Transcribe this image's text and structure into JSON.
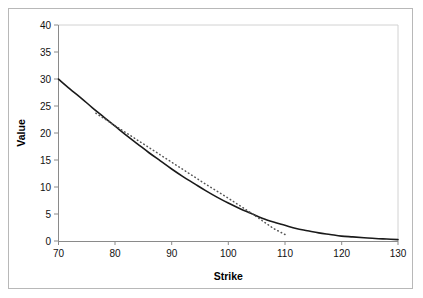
{
  "chart_data": {
    "type": "line",
    "title": "",
    "xlabel": "Strike",
    "ylabel": "Value",
    "xlim": [
      70,
      130
    ],
    "ylim": [
      0,
      40
    ],
    "xticks": [
      70,
      80,
      90,
      100,
      110,
      120,
      130
    ],
    "yticks": [
      0,
      5,
      10,
      15,
      20,
      25,
      30,
      35,
      40
    ],
    "grid": false,
    "legend": "none",
    "series": [
      {
        "name": "solid-curve",
        "style": "solid",
        "color": "#1a1a1a",
        "x": [
          70,
          72,
          74,
          76,
          78,
          80,
          82,
          84,
          86,
          88,
          90,
          92,
          94,
          96,
          98,
          100,
          102,
          104,
          106,
          108,
          110,
          112,
          114,
          116,
          118,
          120,
          122,
          124,
          126,
          128,
          130
        ],
        "y": [
          30.0,
          28.2,
          26.5,
          24.7,
          23.0,
          21.3,
          19.6,
          18.0,
          16.4,
          14.9,
          13.4,
          12.0,
          10.7,
          9.4,
          8.2,
          7.1,
          6.1,
          5.2,
          4.3,
          3.6,
          3.0,
          2.4,
          2.0,
          1.6,
          1.3,
          1.0,
          0.85,
          0.7,
          0.55,
          0.45,
          0.35
        ]
      },
      {
        "name": "dotted-line",
        "style": "dotted",
        "color": "#555555",
        "x": [
          76.6,
          80,
          84,
          88,
          92,
          96,
          100,
          104,
          108,
          110.2
        ],
        "y": [
          23.7,
          21.4,
          18.7,
          16.0,
          13.3,
          10.6,
          8.0,
          5.3,
          2.4,
          1.2
        ]
      }
    ]
  },
  "axis": {
    "y_label": "Value",
    "x_label": "Strike",
    "y_tick_labels": [
      "40",
      "35",
      "30",
      "25",
      "20",
      "15",
      "10",
      "5",
      "0"
    ],
    "x_tick_labels": [
      "70",
      "80",
      "90",
      "100",
      "110",
      "120",
      "130"
    ]
  },
  "colors": {
    "frame": "#b8b8b8",
    "axis": "#8a8a8a",
    "solid_series": "#1a1a1a",
    "dotted_series": "#555555",
    "background": "#ffffff"
  }
}
